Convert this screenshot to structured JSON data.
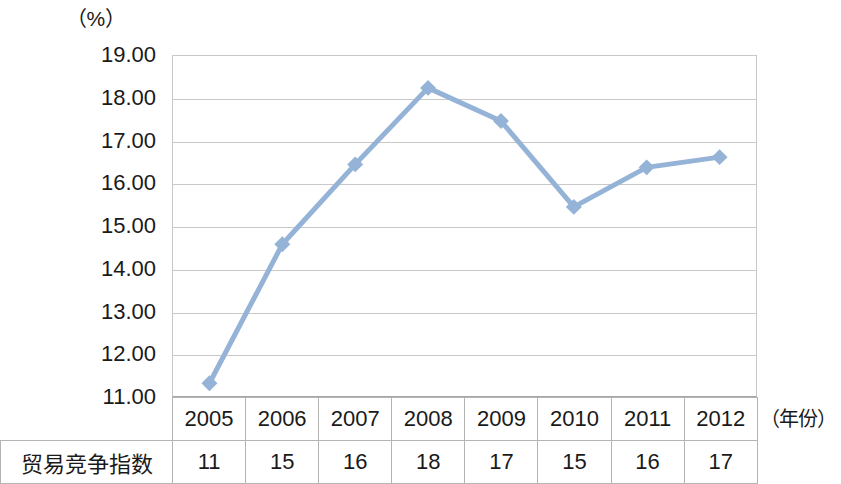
{
  "chart_data": {
    "type": "line",
    "title": "",
    "subtitle": "",
    "xlabel": "（年份）",
    "ylabel": "（%）",
    "unit_label": "（%）",
    "categories": [
      "2005",
      "2006",
      "2007",
      "2008",
      "2009",
      "2010",
      "2011",
      "2012"
    ],
    "series": [
      {
        "name": "贸易竞争指数",
        "values": [
          11.3,
          14.57,
          16.45,
          18.25,
          17.47,
          15.45,
          16.38,
          16.62
        ]
      }
    ],
    "ytick_labels": [
      "19.00",
      "18.00",
      "17.00",
      "16.00",
      "15.00",
      "14.00",
      "13.00",
      "12.00",
      "11.00"
    ],
    "ytick_values": [
      19,
      18,
      17,
      16,
      15,
      14,
      13,
      12,
      11
    ],
    "ylim": [
      11,
      19
    ],
    "grid": true,
    "legend": "none",
    "line_color": "#95b3d7",
    "marker_color": "#95b3d7",
    "gridline_color": "#c9c9c9"
  },
  "table": {
    "row_header_blank": "",
    "year_header": [
      "2005",
      "2006",
      "2007",
      "2008",
      "2009",
      "2010",
      "2011",
      "2012"
    ],
    "rows": [
      {
        "label": "贸易竞争指数",
        "values": [
          "11",
          "15",
          "16",
          "18",
          "17",
          "15",
          "16",
          "17"
        ]
      }
    ]
  }
}
